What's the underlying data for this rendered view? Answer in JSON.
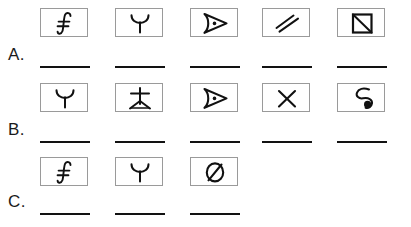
{
  "worksheet": {
    "background_color": "#ffffff",
    "ink_color": "#121212",
    "box_border_color": "#9a9a9a",
    "column_count": 5,
    "rows": [
      {
        "label": "A.",
        "top": 8,
        "label_top": 46,
        "line_top": 66,
        "cells": [
          {
            "glyph": "integral-s-icon",
            "filled": true
          },
          {
            "glyph": "y-bowl-icon",
            "filled": true
          },
          {
            "glyph": "triangle-right-dot-icon",
            "filled": true
          },
          {
            "glyph": "double-slash-icon",
            "filled": true
          },
          {
            "glyph": "square-diagonal-icon",
            "filled": true
          }
        ],
        "blanks": [
          true,
          true,
          true,
          true,
          true
        ]
      },
      {
        "label": "B.",
        "top": 83,
        "label_top": 121,
        "line_top": 141,
        "cells": [
          {
            "glyph": "y-bowl-icon",
            "filled": true
          },
          {
            "glyph": "cross-splayed-legs-icon",
            "filled": true
          },
          {
            "glyph": "triangle-right-dot-icon",
            "filled": true
          },
          {
            "glyph": "x-cross-icon",
            "filled": true
          },
          {
            "glyph": "hook-spiral-dot-icon",
            "filled": true
          }
        ],
        "blanks": [
          true,
          true,
          true,
          true,
          true
        ]
      },
      {
        "label": "C.",
        "top": 157,
        "label_top": 193,
        "line_top": 213,
        "cells": [
          {
            "glyph": "integral-s-icon",
            "filled": true
          },
          {
            "glyph": "y-bowl-icon",
            "filled": true
          },
          {
            "glyph": "circle-slash-icon",
            "filled": true
          },
          {
            "glyph": "empty-slot",
            "filled": false
          },
          {
            "glyph": "empty-slot",
            "filled": false
          }
        ],
        "blanks": [
          true,
          true,
          true,
          false,
          false
        ]
      }
    ],
    "column_left_positions": [
      40,
      115,
      190,
      262,
      337
    ],
    "label_left": 8
  }
}
